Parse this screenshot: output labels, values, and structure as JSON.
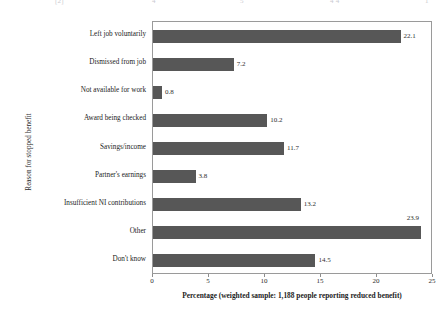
{
  "top_remnant": {
    "fragments": [
      "[2]",
      "4",
      "5",
      "4 4",
      "1"
    ]
  },
  "chart_data": {
    "type": "bar",
    "orientation": "horizontal",
    "title": "",
    "categories": [
      "Left job voluntarily",
      "Dismissed from job",
      "Not available for work",
      "Award being checked",
      "Savings/income",
      "Partner's earnings",
      "Insufficient NI contributions",
      "Other",
      "Don't know"
    ],
    "values": [
      22.1,
      7.2,
      0.8,
      10.2,
      11.7,
      3.8,
      13.2,
      23.9,
      14.5
    ],
    "value_labels": [
      "22.1",
      "7.2",
      "0.8",
      "10.2",
      "11.7",
      "3.8",
      "13.2",
      "23.9",
      "14.5"
    ],
    "xlabel": "Percentage (weighted sample: 1,188 people reporting reduced benefit)",
    "ylabel": "Reason for stopped benefit",
    "xlim": [
      0,
      25
    ],
    "xticks": [
      0,
      5,
      10,
      15,
      20,
      25
    ],
    "xtick_labels": [
      "0",
      "5",
      "10",
      "15",
      "20",
      "25"
    ],
    "grid": false,
    "legend": false,
    "bar_color": "#575757",
    "frame_color": "#9a9a9a"
  }
}
